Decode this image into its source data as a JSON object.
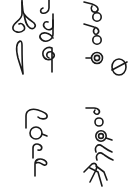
{
  "image": {
    "description": "Rotated script specimen: four groups of Sinhala-like glyphs printed sideways in black on white",
    "orientation": "rotated 90 degrees",
    "ink_color": "#1a1a1a",
    "background_color": "#ffffff"
  },
  "glyph_groups": [
    {
      "name": "group-top-left",
      "label": "Glyph group 1 (top-left, two columns of hooked and looped strokes)"
    },
    {
      "name": "group-top-right",
      "label": "Glyph group 2 (top-right, loop-and-circle sequence ending in a crossed circle)"
    },
    {
      "name": "group-bottom-left",
      "label": "Glyph group 3 (bottom-left, hooked loop, circle, two looped stems)"
    },
    {
      "name": "group-bottom-right",
      "label": "Glyph group 4 (bottom-right, loop, ringed circle, two looped stems, ladder-like glyph)"
    }
  ]
}
